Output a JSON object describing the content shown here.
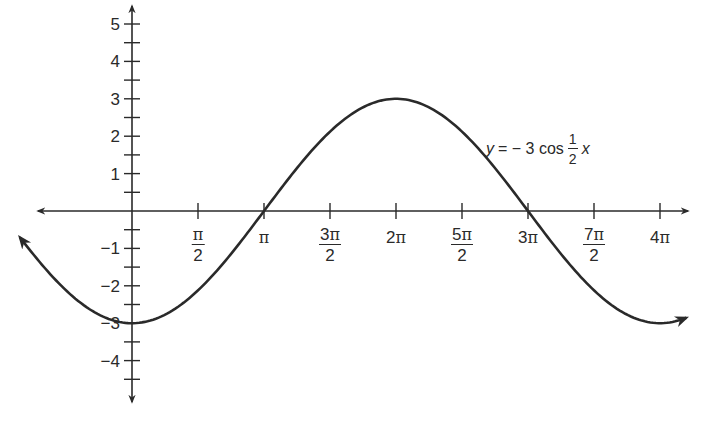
{
  "chart_data": {
    "type": "line",
    "title": "",
    "function": "y = -3 cos(x/2)",
    "annotation": {
      "text_prefix": "y",
      "text_middle": "= − 3 cos",
      "fraction_num": "1",
      "fraction_den": "2",
      "text_suffix": "x",
      "position": "upper right, beside descending curve"
    },
    "xlabel": "",
    "ylabel": "",
    "xlim": [
      -0.85,
      4.2
    ],
    "xlim_units": "multiples of pi",
    "ylim": [
      -4.8,
      5.3
    ],
    "grid": false,
    "legend": "none",
    "x_ticks": [
      {
        "value_pi": 0.5,
        "num": "π",
        "den": "2"
      },
      {
        "value_pi": 1.0,
        "label": "π"
      },
      {
        "value_pi": 1.5,
        "num": "3π",
        "den": "2"
      },
      {
        "value_pi": 2.0,
        "label": "2π"
      },
      {
        "value_pi": 2.5,
        "num": "5π",
        "den": "2"
      },
      {
        "value_pi": 3.0,
        "label": "3π"
      },
      {
        "value_pi": 3.5,
        "num": "7π",
        "den": "2"
      },
      {
        "value_pi": 4.0,
        "label": "4π"
      }
    ],
    "y_ticks": [
      {
        "value": 5,
        "label": "5"
      },
      {
        "value": 4,
        "label": "4"
      },
      {
        "value": 3,
        "label": "3"
      },
      {
        "value": 2,
        "label": "2"
      },
      {
        "value": 1,
        "label": "1"
      },
      {
        "value": -1,
        "label": "−1"
      },
      {
        "value": -2,
        "label": "−2"
      },
      {
        "value": -3,
        "label": "−3"
      },
      {
        "value": -4,
        "label": "−4"
      }
    ],
    "y_minor_ticks": [
      4.5,
      3.5,
      2.5,
      1.5,
      0.5,
      -0.5,
      -1.5,
      -2.5,
      -3.5,
      -4.5
    ],
    "series": [
      {
        "name": "y = -3 cos(x/2)",
        "x_pi": [
          -0.85,
          0,
          0.5,
          1,
          1.5,
          2,
          2.5,
          3,
          3.5,
          4,
          4.2
        ],
        "y": [
          -2.38,
          -3,
          -2.12,
          0,
          2.12,
          3,
          2.12,
          0,
          -2.12,
          -3,
          -2.97
        ],
        "arrows": "both ends",
        "color": "#2a2a2a"
      }
    ],
    "key_points": [
      {
        "label": "minimum",
        "x": "0",
        "y": -3
      },
      {
        "label": "zero",
        "x": "π",
        "y": 0
      },
      {
        "label": "maximum",
        "x": "2π",
        "y": 3
      },
      {
        "label": "zero",
        "x": "3π",
        "y": 0
      },
      {
        "label": "minimum",
        "x": "4π",
        "y": -3
      }
    ]
  },
  "colors": {
    "ink": "#2a2a2a",
    "background": "#ffffff"
  }
}
